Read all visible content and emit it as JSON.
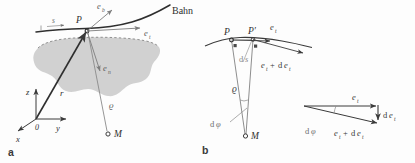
{
  "figure": {
    "background_color": "#fdfdfd",
    "ink_color": "#3a3a3a",
    "light_ink_color": "#8a8a8a",
    "shade_color": "#c9c9c9",
    "caption_a": "a",
    "caption_b": "b"
  },
  "panel_a": {
    "name": "begleitendes Dreibein",
    "curve_label": "Bahn",
    "point_P": "P",
    "center_M": "M",
    "arclength": "s",
    "radius_vector": "r",
    "curvature_radius": "ϱ",
    "unit_vectors": {
      "binormal": {
        "base": "e",
        "sub": "b"
      },
      "tangent": {
        "base": "e",
        "sub": "t"
      },
      "normal": {
        "base": "e",
        "sub": "n"
      }
    },
    "axes": {
      "z": "z",
      "y": "y",
      "x": "x",
      "origin": "0"
    }
  },
  "panel_b": {
    "point_P": "P",
    "point_P_prime": "P′",
    "center_M": "M",
    "arc_element": {
      "d": "d",
      "s": "s"
    },
    "curvature_radius": "ϱ",
    "angle_element": {
      "d": "d",
      "phi": "φ"
    },
    "tangent_unit": {
      "base": "e",
      "sub": "t"
    },
    "tangent_unit_shifted": {
      "base": "e",
      "sub": "t",
      "plus": "+",
      "d": "d"
    },
    "right_angle_marker": "▪"
  },
  "panel_b_triangle": {
    "vector_top": {
      "base": "e",
      "sub": "t"
    },
    "vector_delta": {
      "d": "d",
      "base": "e",
      "sub": "t"
    },
    "vector_bottom": {
      "base": "e",
      "sub": "t",
      "plus": "+",
      "d": "d"
    },
    "angle_label": {
      "d": "d",
      "phi": "φ"
    }
  }
}
